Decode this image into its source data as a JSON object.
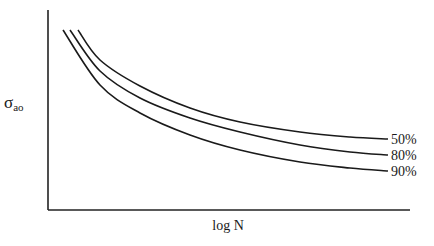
{
  "chart_data": {
    "type": "line",
    "title": "",
    "xlabel": "log N",
    "ylabel": "σ_ao",
    "ylabel_main": "σ",
    "ylabel_sub": "ao",
    "grid": false,
    "ticks": "none (schematic)",
    "legend_position": "inline labels at right end of each curve",
    "series": [
      {
        "name": "50%",
        "label": "50%",
        "points_px": [
          [
            78,
            30
          ],
          [
            100,
            60
          ],
          [
            140,
            86
          ],
          [
            190,
            108
          ],
          [
            240,
            122
          ],
          [
            300,
            132
          ],
          [
            350,
            137
          ],
          [
            388,
            139
          ]
        ]
      },
      {
        "name": "80%",
        "label": "80%",
        "points_px": [
          [
            70,
            30
          ],
          [
            100,
            71
          ],
          [
            140,
            98
          ],
          [
            190,
            118
          ],
          [
            240,
            132
          ],
          [
            300,
            145
          ],
          [
            350,
            152
          ],
          [
            388,
            155
          ]
        ]
      },
      {
        "name": "90%",
        "label": "90%",
        "points_px": [
          [
            63,
            30
          ],
          [
            100,
            85
          ],
          [
            140,
            113
          ],
          [
            190,
            135
          ],
          [
            240,
            150
          ],
          [
            300,
            162
          ],
          [
            350,
            168
          ],
          [
            388,
            171
          ]
        ]
      }
    ],
    "axes_px": {
      "origin": [
        48,
        210
      ],
      "y_top": [
        48,
        10
      ],
      "x_right": [
        410,
        210
      ]
    }
  }
}
